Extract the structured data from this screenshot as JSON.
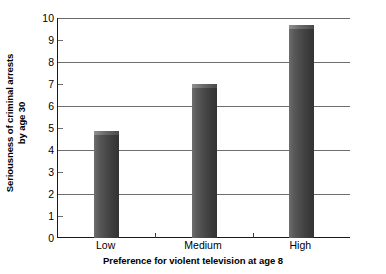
{
  "chart_data": {
    "type": "bar",
    "title": "",
    "subtitle": "",
    "categories": [
      "Low",
      "Medium",
      "High"
    ],
    "values": [
      4.85,
      7.0,
      9.7
    ],
    "series": [
      {
        "name": "Seriousness of criminal arrests by age 30",
        "values": [
          4.85,
          7.0,
          9.7
        ]
      }
    ],
    "xlabel": "Preference for violent television at age 8",
    "ylabel_line1": "Seriousness of criminal arrests",
    "ylabel_line2": "by age 30",
    "ylabel": "Seriousness of criminal arrests by age 30",
    "ylim": [
      0,
      10
    ],
    "yticks": [
      0,
      1,
      2,
      3,
      4,
      5,
      6,
      7,
      8,
      9,
      10
    ],
    "ytick_labels": [
      "0",
      "1",
      "2",
      "3",
      "4",
      "5",
      "6",
      "7",
      "8",
      "9",
      "10"
    ],
    "gridline_values": [
      2,
      4,
      6,
      8,
      10
    ],
    "tickmark_values": [
      1,
      3,
      5,
      7,
      9
    ],
    "grid": true,
    "legend": false,
    "legend_position": "none",
    "bar_color": "#4a4a4a",
    "background_color": "#ffffff",
    "axis_color": "#1a1a1a",
    "grid_color": "#6f6f6f"
  }
}
